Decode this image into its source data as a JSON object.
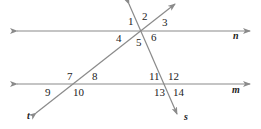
{
  "diagram": {
    "line_color": "#8a8a8a",
    "lines": [
      {
        "name": "n",
        "x1": 17,
        "y1": 31,
        "x2": 250,
        "y2": 31,
        "label_x": 233,
        "label_y": 39
      },
      {
        "name": "m",
        "x1": 17,
        "y1": 84,
        "x2": 250,
        "y2": 84,
        "label_x": 232,
        "label_y": 93
      },
      {
        "name": "t",
        "x1": 36,
        "y1": 113,
        "x2": 175,
        "y2": 4,
        "label_x": 27,
        "label_y": 119
      },
      {
        "name": "s",
        "x1": 129,
        "y1": 4,
        "x2": 177,
        "y2": 114,
        "label_x": 184,
        "label_y": 120
      }
    ],
    "angle_labels": [
      {
        "text": "1",
        "x": 128,
        "y": 25
      },
      {
        "text": "2",
        "x": 142,
        "y": 20
      },
      {
        "text": "3",
        "x": 162,
        "y": 26
      },
      {
        "text": "4",
        "x": 116,
        "y": 42
      },
      {
        "text": "5",
        "x": 136,
        "y": 46
      },
      {
        "text": "6",
        "x": 151,
        "y": 41
      },
      {
        "text": "7",
        "x": 67,
        "y": 80
      },
      {
        "text": "8",
        "x": 92,
        "y": 80
      },
      {
        "text": "9",
        "x": 45,
        "y": 96
      },
      {
        "text": "10",
        "x": 73,
        "y": 96
      },
      {
        "text": "11",
        "x": 149,
        "y": 80
      },
      {
        "text": "12",
        "x": 168,
        "y": 80
      },
      {
        "text": "13",
        "x": 154,
        "y": 96
      },
      {
        "text": "14",
        "x": 173,
        "y": 96
      }
    ]
  }
}
